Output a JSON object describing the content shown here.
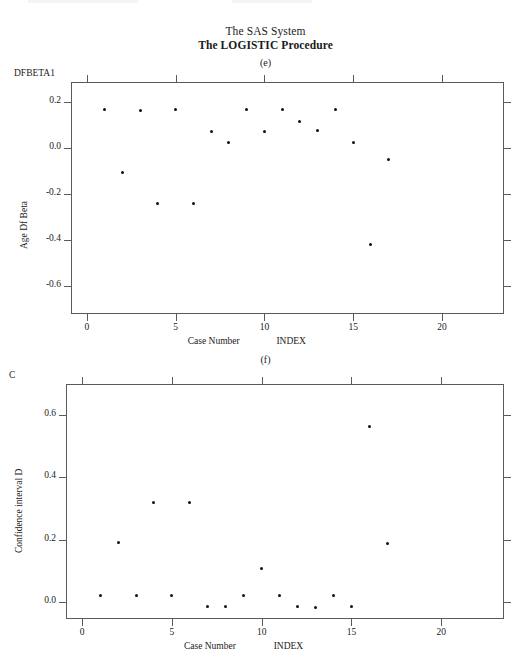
{
  "document": {
    "title_line1": "The SAS System",
    "title_line2": "The LOGISTIC Procedure"
  },
  "panels": [
    {
      "letter": "(e)",
      "axis_head": "DFBETA1",
      "ylabel": "Age Df Beta",
      "xlabel_left": "Case Number",
      "xlabel_right": "INDEX",
      "yticks": [
        "0.2",
        "0.0",
        "-0.2",
        "-0.4",
        "-0.6"
      ],
      "xticks": [
        "0",
        "5",
        "10",
        "15",
        "20"
      ]
    },
    {
      "letter": "(f)",
      "axis_head": "C",
      "ylabel": "Confidence interval D",
      "xlabel_left": "Case Number",
      "xlabel_right": "INDEX",
      "yticks": [
        "0.6",
        "0.4",
        "0.2",
        "0.0"
      ],
      "xticks": [
        "0",
        "5",
        "10",
        "15",
        "20"
      ]
    }
  ],
  "chart_data": [
    {
      "type": "scatter",
      "id": "panel-e",
      "title": "The SAS System / The LOGISTIC Procedure (e)",
      "subtitle": "(e)",
      "xlabel": "Case Number    INDEX",
      "ylabel": "Age Df Beta",
      "axis_head": "DFBETA1",
      "xlim": [
        -0.9,
        23.5
      ],
      "ylim": [
        -0.72,
        0.285
      ],
      "xticks": [
        0,
        5,
        10,
        15,
        20
      ],
      "yticks": [
        0.2,
        0.0,
        -0.2,
        -0.4,
        -0.6
      ],
      "grid": false,
      "legend": false,
      "marker": "filled-circle",
      "x": [
        1,
        2,
        3,
        4,
        5,
        6,
        7,
        8,
        9,
        10,
        11,
        12,
        13,
        14,
        15,
        16,
        17
      ],
      "y": [
        0.165,
        -0.105,
        0.16,
        -0.24,
        0.165,
        -0.24,
        0.07,
        0.025,
        0.165,
        0.07,
        0.165,
        0.115,
        0.075,
        0.165,
        0.025,
        -0.42,
        -0.05
      ]
    },
    {
      "type": "scatter",
      "id": "panel-f",
      "title": "The SAS System / The LOGISTIC Procedure (f)",
      "subtitle": "(f)",
      "xlabel": "Case Number    INDEX",
      "ylabel": "Confidence interval D",
      "axis_head": "C",
      "xlim": [
        -0.9,
        23.5
      ],
      "ylim": [
        -0.055,
        0.7
      ],
      "xticks": [
        0,
        5,
        10,
        15,
        20
      ],
      "yticks": [
        0.6,
        0.4,
        0.2,
        0.0
      ],
      "grid": false,
      "legend": false,
      "marker": "filled-circle",
      "x": [
        1,
        2,
        3,
        4,
        5,
        6,
        7,
        8,
        9,
        10,
        11,
        12,
        13,
        14,
        15,
        16,
        17
      ],
      "y": [
        0.022,
        0.19,
        0.022,
        0.32,
        0.022,
        0.32,
        -0.015,
        -0.015,
        0.022,
        0.108,
        0.022,
        -0.015,
        -0.018,
        0.022,
        -0.015,
        0.565,
        0.188
      ]
    }
  ]
}
